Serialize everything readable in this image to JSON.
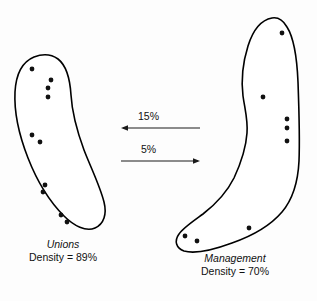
{
  "figure": {
    "type": "network-cluster-diagram",
    "background_color": "#fdfdfd",
    "stroke_color": "#000000",
    "dot_color": "#111111"
  },
  "clusters": [
    {
      "id": "unions",
      "name": "Unions",
      "density_label": "Density = 89%",
      "density_value": 89,
      "member_count": 9,
      "shape": "crescent",
      "outline_path": "M 34 57 C 22 62, 16 74, 15 92 C 14 112, 19 135, 28 158 C 37 181, 50 202, 64 216 C 74 226, 86 232, 95 228 C 104 224, 107 214, 104 202 C 100 186, 91 168, 84 150 C 77 131, 72 112, 71 95 C 70 79, 67 66, 58 59 C 51 54, 42 54, 34 57 Z",
      "dots": [
        {
          "x": 32,
          "y": 69
        },
        {
          "x": 51,
          "y": 80
        },
        {
          "x": 48,
          "y": 88
        },
        {
          "x": 48,
          "y": 97
        },
        {
          "x": 32,
          "y": 135
        },
        {
          "x": 40,
          "y": 142
        },
        {
          "x": 45,
          "y": 185
        },
        {
          "x": 43,
          "y": 192
        },
        {
          "x": 61,
          "y": 215
        },
        {
          "x": 67,
          "y": 222
        }
      ],
      "label_left": 14,
      "label_top": 238,
      "label_width": 98
    },
    {
      "id": "management",
      "name": "Management",
      "density_label": "Density = 70%",
      "density_value": 70,
      "member_count": 8,
      "shape": "boot",
      "outline_path": "M 272 18 C 261 20, 253 30, 248 46 C 243 62, 241 80, 243 96 C 245 110, 248 120, 247 133 C 246 148, 241 163, 234 178 C 227 192, 216 204, 203 214 C 192 222, 183 228, 179 234 C 174 241, 176 248, 184 251 C 194 254, 213 250, 232 243 C 252 236, 270 226, 282 212 C 293 199, 298 182, 299 161 C 300 137, 299 110, 298 82 C 297 58, 294 38, 287 27 C 283 20, 278 17, 272 18 Z",
      "dots": [
        {
          "x": 282,
          "y": 33
        },
        {
          "x": 263,
          "y": 97
        },
        {
          "x": 287,
          "y": 119
        },
        {
          "x": 287,
          "y": 128
        },
        {
          "x": 287,
          "y": 141
        },
        {
          "x": 249,
          "y": 228
        },
        {
          "x": 185,
          "y": 236
        },
        {
          "x": 197,
          "y": 241
        }
      ],
      "label_left": 173,
      "label_top": 252,
      "label_width": 124
    }
  ],
  "flows": [
    {
      "id": "management-to-unions",
      "label": "15%",
      "value": 15,
      "direction": "left",
      "line_y": 128,
      "x_start": 200,
      "x_end": 121,
      "label_left": 138,
      "label_top": 110
    },
    {
      "id": "unions-to-management",
      "label": "5%",
      "value": 5,
      "direction": "right",
      "line_y": 161,
      "x_start": 121,
      "x_end": 200,
      "label_left": 141,
      "label_top": 143
    }
  ],
  "cropped_header": {
    "text": "",
    "visible": false
  }
}
